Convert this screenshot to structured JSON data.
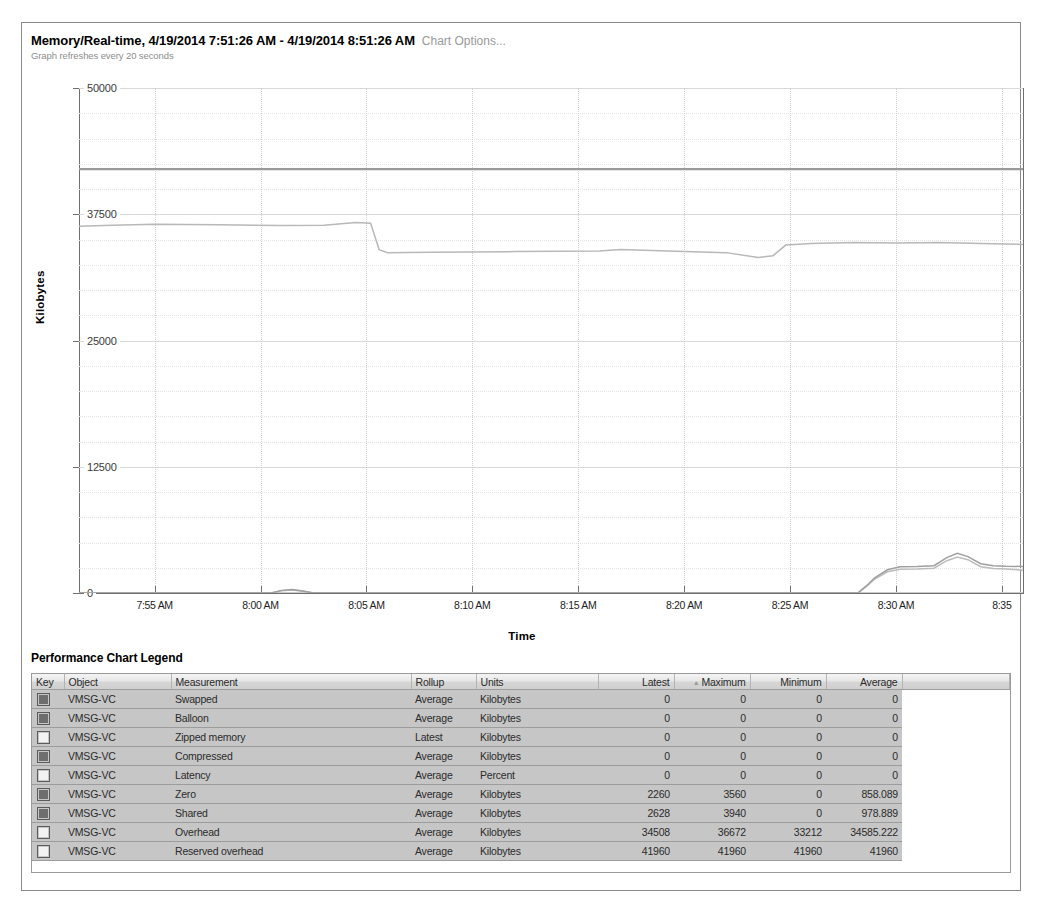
{
  "header": {
    "title": "Memory/Real-time, 4/19/2014 7:51:26 AM - 4/19/2014 8:51:26 AM",
    "options_link": "Chart Options...",
    "refresh_note": "Graph refreshes every 20 seconds"
  },
  "legend": {
    "title": "Performance Chart Legend",
    "columns": [
      "Key",
      "Object",
      "Measurement",
      "Rollup",
      "Units",
      "Latest",
      "Maximum",
      "Minimum",
      "Average"
    ],
    "sorted_column": "Maximum",
    "sort_direction": "asc",
    "rows": [
      {
        "key": "filled",
        "object": "VMSG-VC",
        "measurement": "Swapped",
        "rollup": "Average",
        "units": "Kilobytes",
        "latest": "0",
        "maximum": "0",
        "minimum": "0",
        "average": "0"
      },
      {
        "key": "filled",
        "object": "VMSG-VC",
        "measurement": "Balloon",
        "rollup": "Average",
        "units": "Kilobytes",
        "latest": "0",
        "maximum": "0",
        "minimum": "0",
        "average": "0"
      },
      {
        "key": "empty",
        "object": "VMSG-VC",
        "measurement": "Zipped memory",
        "rollup": "Latest",
        "units": "Kilobytes",
        "latest": "0",
        "maximum": "0",
        "minimum": "0",
        "average": "0"
      },
      {
        "key": "filled",
        "object": "VMSG-VC",
        "measurement": "Compressed",
        "rollup": "Average",
        "units": "Kilobytes",
        "latest": "0",
        "maximum": "0",
        "minimum": "0",
        "average": "0"
      },
      {
        "key": "empty",
        "object": "VMSG-VC",
        "measurement": "Latency",
        "rollup": "Average",
        "units": "Percent",
        "latest": "0",
        "maximum": "0",
        "minimum": "0",
        "average": "0"
      },
      {
        "key": "filled",
        "object": "VMSG-VC",
        "measurement": "Zero",
        "rollup": "Average",
        "units": "Kilobytes",
        "latest": "2260",
        "maximum": "3560",
        "minimum": "0",
        "average": "858.089"
      },
      {
        "key": "filled",
        "object": "VMSG-VC",
        "measurement": "Shared",
        "rollup": "Average",
        "units": "Kilobytes",
        "latest": "2628",
        "maximum": "3940",
        "minimum": "0",
        "average": "978.889"
      },
      {
        "key": "empty",
        "object": "VMSG-VC",
        "measurement": "Overhead",
        "rollup": "Average",
        "units": "Kilobytes",
        "latest": "34508",
        "maximum": "36672",
        "minimum": "33212",
        "average": "34585.222"
      },
      {
        "key": "empty",
        "object": "VMSG-VC",
        "measurement": "Reserved overhead",
        "rollup": "Average",
        "units": "Kilobytes",
        "latest": "41960",
        "maximum": "41960",
        "minimum": "41960",
        "average": "41960"
      }
    ]
  },
  "chart_data": {
    "type": "line",
    "title": "Memory/Real-time, 4/19/2014 7:51:26 AM - 4/19/2014 8:51:26 AM",
    "xlabel": "Time",
    "ylabel": "Kilobytes",
    "ylim": [
      0,
      50000
    ],
    "yticks": [
      0,
      12500,
      25000,
      37500,
      50000
    ],
    "ytick_labels": [
      "0",
      "12500",
      "25000",
      "37500",
      "50000"
    ],
    "xtick_labels": [
      "7:55 AM",
      "8:00 AM",
      "8:05 AM",
      "8:10 AM",
      "8:15 AM",
      "8:20 AM",
      "8:25 AM",
      "8:30 AM",
      "8:35"
    ],
    "grid": true,
    "legend_position": "below-chart-table",
    "x_start_minutes": 471.43,
    "x_end_minutes": 516.0,
    "series": [
      {
        "name": "Reserved overhead",
        "color": "#9a9a9a",
        "points": [
          [
            471.4,
            41960
          ],
          [
            480,
            41960
          ],
          [
            490,
            41960
          ],
          [
            500,
            41960
          ],
          [
            510,
            41960
          ],
          [
            516,
            41960
          ]
        ]
      },
      {
        "name": "Overhead",
        "color": "#b8b8b8",
        "points": [
          [
            471.4,
            36300
          ],
          [
            473,
            36400
          ],
          [
            475,
            36500
          ],
          [
            478,
            36450
          ],
          [
            481,
            36380
          ],
          [
            483,
            36420
          ],
          [
            484.5,
            36672
          ],
          [
            485.2,
            36600
          ],
          [
            485.6,
            34000
          ],
          [
            486,
            33700
          ],
          [
            488,
            33750
          ],
          [
            492,
            33800
          ],
          [
            496,
            33850
          ],
          [
            497,
            34000
          ],
          [
            500,
            33800
          ],
          [
            502,
            33700
          ],
          [
            503.5,
            33212
          ],
          [
            504.2,
            33400
          ],
          [
            504.8,
            34450
          ],
          [
            506,
            34600
          ],
          [
            508,
            34700
          ],
          [
            510,
            34650
          ],
          [
            512,
            34700
          ],
          [
            514,
            34600
          ],
          [
            516,
            34508
          ]
        ]
      },
      {
        "name": "Shared",
        "color": "#9f9f9f",
        "points": [
          [
            471.4,
            0
          ],
          [
            478,
            0
          ],
          [
            480.5,
            0
          ],
          [
            481,
            260
          ],
          [
            481.5,
            340
          ],
          [
            482,
            200
          ],
          [
            482.5,
            0
          ],
          [
            486,
            0
          ],
          [
            494,
            0
          ],
          [
            500,
            0
          ],
          [
            505,
            0
          ],
          [
            508.2,
            0
          ],
          [
            508.6,
            700
          ],
          [
            509,
            1500
          ],
          [
            509.6,
            2300
          ],
          [
            510.2,
            2600
          ],
          [
            511,
            2620
          ],
          [
            511.8,
            2700
          ],
          [
            512.4,
            3500
          ],
          [
            512.9,
            3940
          ],
          [
            513.4,
            3600
          ],
          [
            514,
            2900
          ],
          [
            514.6,
            2700
          ],
          [
            515.2,
            2650
          ],
          [
            516,
            2628
          ]
        ]
      },
      {
        "name": "Zero",
        "color": "#bcbcbc",
        "points": [
          [
            471.4,
            0
          ],
          [
            478,
            0
          ],
          [
            480.5,
            0
          ],
          [
            481,
            220
          ],
          [
            481.5,
            300
          ],
          [
            482,
            180
          ],
          [
            482.5,
            0
          ],
          [
            486,
            0
          ],
          [
            494,
            0
          ],
          [
            500,
            0
          ],
          [
            505,
            0
          ],
          [
            508.2,
            0
          ],
          [
            508.6,
            620
          ],
          [
            509,
            1380
          ],
          [
            509.6,
            2100
          ],
          [
            510.2,
            2350
          ],
          [
            511,
            2380
          ],
          [
            511.8,
            2450
          ],
          [
            512.4,
            3200
          ],
          [
            512.9,
            3560
          ],
          [
            513.4,
            3300
          ],
          [
            514,
            2600
          ],
          [
            514.6,
            2420
          ],
          [
            515.2,
            2380
          ],
          [
            516,
            2260
          ]
        ]
      },
      {
        "name": "Swapped",
        "color": "#c9c9c9",
        "points": [
          [
            471.4,
            0
          ],
          [
            516,
            0
          ]
        ]
      },
      {
        "name": "Balloon",
        "color": "#d2d2d2",
        "points": [
          [
            471.4,
            0
          ],
          [
            516,
            0
          ]
        ]
      },
      {
        "name": "Zipped memory",
        "color": "#d8d8d8",
        "points": [
          [
            471.4,
            0
          ],
          [
            516,
            0
          ]
        ]
      },
      {
        "name": "Compressed",
        "color": "#dedede",
        "points": [
          [
            471.4,
            0
          ],
          [
            516,
            0
          ]
        ]
      },
      {
        "name": "Latency",
        "color": "#e3e3e3",
        "points": [
          [
            471.4,
            0
          ],
          [
            516,
            0
          ]
        ]
      }
    ]
  }
}
